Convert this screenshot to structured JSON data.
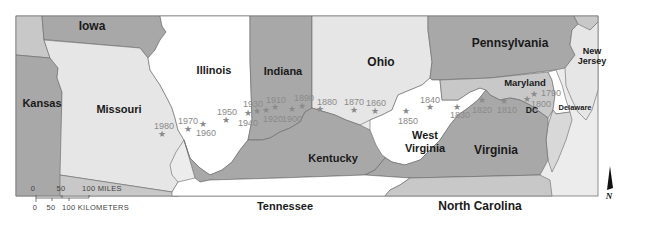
{
  "map": {
    "title": "",
    "states": [
      {
        "name": "Iowa",
        "label": "Iowa"
      },
      {
        "name": "Kansas",
        "label": "Kansas"
      },
      {
        "name": "Missouri",
        "label": "Missouri"
      },
      {
        "name": "Illinois",
        "label": "Illinois"
      },
      {
        "name": "Indiana",
        "label": "Indiana"
      },
      {
        "name": "Ohio",
        "label": "Ohio"
      },
      {
        "name": "Pennsylvania",
        "label": "Pennsylvania"
      },
      {
        "name": "New Jersey",
        "label_line1": "New",
        "label_line2": "Jersey"
      },
      {
        "name": "Maryland",
        "label": "Maryland"
      },
      {
        "name": "Delaware",
        "label": "Delaware"
      },
      {
        "name": "DC",
        "label": "DC"
      },
      {
        "name": "West Virginia",
        "label_line1": "West",
        "label_line2": "Virginia"
      },
      {
        "name": "Virginia",
        "label": "Virginia"
      },
      {
        "name": "Kentucky",
        "label": "Kentucky"
      },
      {
        "name": "Tennessee",
        "label": "Tennessee"
      },
      {
        "name": "North Carolina",
        "label": "North Carolina"
      }
    ],
    "population_center_markers": [
      {
        "year": "1790"
      },
      {
        "year": "1800"
      },
      {
        "year": "1810"
      },
      {
        "year": "1820"
      },
      {
        "year": "1830"
      },
      {
        "year": "1840"
      },
      {
        "year": "1850"
      },
      {
        "year": "1860"
      },
      {
        "year": "1870"
      },
      {
        "year": "1880"
      },
      {
        "year": "1890"
      },
      {
        "year": "1900"
      },
      {
        "year": "1910"
      },
      {
        "year": "1920"
      },
      {
        "year": "1930"
      },
      {
        "year": "1940"
      },
      {
        "year": "1950"
      },
      {
        "year": "1960"
      },
      {
        "year": "1970"
      },
      {
        "year": "1980"
      }
    ],
    "scale_bar": {
      "miles_ticks": [
        "0",
        "50",
        "100 MILES"
      ],
      "km_ticks": [
        "0",
        "50",
        "100 KILOMETERS"
      ]
    },
    "north_arrow": {
      "label": "N"
    },
    "colors": {
      "white_state": "#ffffff",
      "light_state": "#e6e6e6",
      "mid_state": "#c8c8c8",
      "dark_state": "#a8a8a8",
      "water": "#ececec",
      "border": "#555555",
      "marker": "#8a8a8a"
    }
  }
}
